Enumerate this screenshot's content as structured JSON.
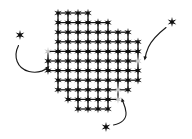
{
  "figure": {
    "canvas": {
      "width": 192,
      "height": 139,
      "background": "#ffffff"
    }
  },
  "colors": {
    "lattice_atom": "#0d0d0d",
    "vacancy_atom": "#c9c9c9",
    "free_atom": "#0d0d0d",
    "bond": "#141414",
    "arrow": "#1a1a1a",
    "background": "#ffffff"
  },
  "style": {
    "atom_radius": 4.3,
    "atom_points": 6,
    "atom_inner_ratio": 0.33,
    "bond_width": 1.25,
    "arrow_width": 1.15,
    "lattice_spacing_x": 10.0,
    "lattice_spacing_y": 9.6
  },
  "lattice": {
    "label": "crystal-lattice",
    "origin": {
      "x": 58.0,
      "y": 13.0
    },
    "rows": [
      {
        "row": 0,
        "cols": [
          0,
          1,
          2,
          3
        ]
      },
      {
        "row": 1,
        "cols": [
          0,
          1,
          2,
          3,
          4,
          5
        ]
      },
      {
        "row": 2,
        "cols": [
          0,
          1,
          2,
          3,
          4,
          5,
          6,
          7
        ]
      },
      {
        "row": 3,
        "cols": [
          0,
          1,
          2,
          3,
          4,
          5,
          6,
          7,
          8
        ]
      },
      {
        "row": 4,
        "cols": [
          -1,
          0,
          1,
          2,
          3,
          4,
          5,
          6,
          7,
          8
        ]
      },
      {
        "row": 5,
        "cols": [
          -1,
          0,
          1,
          2,
          3,
          4,
          5,
          6,
          7,
          8
        ]
      },
      {
        "row": 6,
        "cols": [
          -1,
          0,
          1,
          2,
          3,
          4,
          5,
          6,
          7,
          8
        ]
      },
      {
        "row": 7,
        "cols": [
          0,
          1,
          2,
          3,
          4,
          5,
          6,
          7,
          8
        ]
      },
      {
        "row": 8,
        "cols": [
          0,
          1,
          2,
          3,
          4,
          5,
          6,
          7
        ]
      },
      {
        "row": 9,
        "cols": [
          1,
          2,
          3,
          4,
          5,
          6
        ]
      },
      {
        "row": 10,
        "cols": [
          2,
          3,
          4,
          5
        ]
      }
    ],
    "vacancy_sites": [
      {
        "name": "vacancy-left",
        "row": 4,
        "col": -1
      },
      {
        "name": "vacancy-right",
        "row": 5,
        "col": 8
      },
      {
        "name": "vacancy-bottom",
        "row": 8,
        "col": 6
      },
      {
        "name": "vacancy-bottom-edge",
        "row": 9,
        "col": 6
      }
    ]
  },
  "free_atoms": [
    {
      "name": "free-atom-left",
      "x": 20.0,
      "y": 35.0,
      "radius": 5.0
    },
    {
      "name": "free-atom-top-right",
      "x": 172.0,
      "y": 22.0,
      "radius": 5.0
    },
    {
      "name": "free-atom-bottom",
      "x": 106.0,
      "y": 127.0,
      "radius": 5.0
    }
  ],
  "arrows": [
    {
      "name": "arrow-left-to-lattice",
      "from_atom": "free-atom-left",
      "to_site": "vacancy-left",
      "path": "M 18.5 45.5 C 13.0 56.5, 17.0 68.5, 29.0 71.5 C 36.5 73.3, 43.0 71.5, 48.0 67.5",
      "head": {
        "x": 49.5,
        "y": 66.2,
        "angle": -37
      }
    },
    {
      "name": "arrow-top-right-to-lattice",
      "from_atom": "free-atom-top-right",
      "to_site": "vacancy-right",
      "path": "M 166.0 27.5 C 159.0 33.0, 152.0 39.5, 148.5 47.0 C 146.5 51.5, 145.5 55.0, 145.0 58.5",
      "head": {
        "x": 144.6,
        "y": 60.5,
        "angle": 100
      }
    },
    {
      "name": "arrow-bottom-to-lattice",
      "from_atom": "free-atom-bottom",
      "to_site": "vacancy-bottom",
      "path": "M 113.5 125.0 C 121.5 123.5, 126.5 119.0, 126.0 112.5 C 125.6 107.0, 123.5 103.5, 122.3 100.0",
      "head": {
        "x": 121.7,
        "y": 98.0,
        "angle": -107
      }
    }
  ],
  "semantics": {
    "diagram_type": "lattice-adsorption-schematic",
    "atom_count_lattice": 83,
    "vacancy_count": 4,
    "free_atom_count": 3,
    "arrow_count": 3
  }
}
